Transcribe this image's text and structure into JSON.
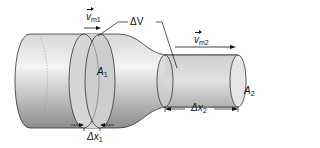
{
  "diagram": {
    "type": "continuity-flow-tube",
    "labels": {
      "velocity1": {
        "symbol": "v",
        "subscript": "m1"
      },
      "velocity2": {
        "symbol": "v",
        "subscript": "m2"
      },
      "volume": {
        "symbol": "ΔV"
      },
      "area1": {
        "symbol": "A",
        "subscript": "1"
      },
      "area2": {
        "symbol": "A",
        "subscript": "2"
      },
      "dx1": {
        "symbol": "Δx",
        "subscript": "1"
      },
      "dx2": {
        "symbol": "Δx",
        "subscript": "2"
      }
    },
    "colors": {
      "tube_light": "#f2f2f2",
      "tube_dark": "#9a9a9a",
      "slice_fill": "#cfcfcf",
      "outline": "#333333"
    }
  }
}
